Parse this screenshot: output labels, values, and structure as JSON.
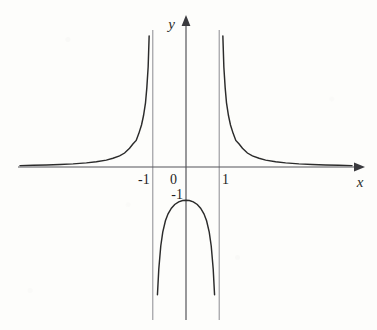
{
  "figure": {
    "title": "",
    "axis_labels": {
      "x": "x",
      "y": "y"
    },
    "tick_labels": {
      "x_neg_one": "-1",
      "x_zero": "0",
      "x_one": "1",
      "y_neg_one": "-1"
    },
    "colors": {
      "curve": "#2b2b2b",
      "axis": "#55555a",
      "asymptote": "#8a8a90",
      "background": "#fdfdfb",
      "text": "#1f1f1f"
    }
  },
  "chart_data": {
    "type": "line",
    "title": "",
    "xlabel": "x",
    "ylabel": "y",
    "function": "y = 1/(x^2 - 1)",
    "xlim": [
      -5.1,
      5.4
    ],
    "ylim": [
      -4.6,
      4.2
    ],
    "grid": false,
    "legend": null,
    "xticks": [
      -1,
      0,
      1
    ],
    "xtick_labels": [
      "-1",
      "0",
      "1"
    ],
    "yticks": [
      -1
    ],
    "ytick_labels": [
      "-1"
    ],
    "asymptotes": {
      "vertical": [
        -1,
        1
      ],
      "horizontal": [
        0
      ]
    },
    "annotations": [
      {
        "text": "-1",
        "x": -1,
        "y": 0,
        "role": "x-tick"
      },
      {
        "text": "0",
        "x": 0,
        "y": 0,
        "role": "origin"
      },
      {
        "text": "1",
        "x": 1,
        "y": 0,
        "role": "x-tick"
      },
      {
        "text": "-1",
        "x": 0,
        "y": -1,
        "role": "y-tick-vertex"
      }
    ],
    "series": [
      {
        "name": "left-branch",
        "comment": "x < -1, y = 1/(x^2-1) positive, approaches 0 from above",
        "x": [
          -5.0,
          -4.6,
          -4.2,
          -3.8,
          -3.4,
          -3.0,
          -2.7,
          -2.4,
          -2.2,
          -2.0,
          -1.85,
          -1.7,
          -1.6,
          -1.5,
          -1.42,
          -1.34,
          -1.28,
          -1.22,
          -1.18,
          -1.14,
          -1.11,
          -1.08,
          -1.06,
          -1.045,
          -1.035
        ],
        "y": [
          0.042,
          0.05,
          0.06,
          0.074,
          0.094,
          0.125,
          0.158,
          0.206,
          0.263,
          0.333,
          0.421,
          0.565,
          0.694,
          0.8,
          1.013,
          1.267,
          1.543,
          1.934,
          2.384,
          3.01,
          3.95,
          5.319,
          6.81,
          8.88,
          11.6
        ]
      },
      {
        "name": "right-branch",
        "comment": "x > 1, mirror of left branch",
        "x": [
          1.035,
          1.045,
          1.06,
          1.08,
          1.11,
          1.14,
          1.18,
          1.22,
          1.28,
          1.34,
          1.42,
          1.5,
          1.6,
          1.7,
          1.85,
          2.0,
          2.2,
          2.4,
          2.7,
          3.0,
          3.4,
          3.8,
          4.2,
          4.6,
          5.0
        ],
        "y": [
          11.6,
          8.88,
          6.81,
          5.319,
          3.95,
          3.01,
          2.384,
          1.934,
          1.543,
          1.267,
          1.013,
          0.8,
          0.694,
          0.565,
          0.421,
          0.333,
          0.263,
          0.206,
          0.158,
          0.125,
          0.094,
          0.074,
          0.06,
          0.05,
          0.042
        ]
      },
      {
        "name": "middle-branch",
        "comment": "-1 < x < 1, y <= -1, vertex at (0,-1)",
        "x": [
          -0.965,
          -0.95,
          -0.93,
          -0.9,
          -0.86,
          -0.82,
          -0.76,
          -0.7,
          -0.62,
          -0.54,
          -0.44,
          -0.34,
          -0.22,
          -0.1,
          0.0,
          0.1,
          0.22,
          0.34,
          0.44,
          0.54,
          0.62,
          0.7,
          0.76,
          0.82,
          0.86,
          0.9,
          0.93,
          0.95,
          0.965
        ],
        "y": [
          -14.4,
          -10.26,
          -7.42,
          -5.26,
          -3.85,
          -3.08,
          -2.38,
          -1.96,
          -1.62,
          -1.41,
          -1.24,
          -1.13,
          -1.05,
          -1.01,
          -1.0,
          -1.01,
          -1.05,
          -1.13,
          -1.24,
          -1.41,
          -1.62,
          -1.96,
          -2.38,
          -3.08,
          -3.85,
          -5.26,
          -7.42,
          -10.26,
          -14.4
        ]
      }
    ]
  }
}
